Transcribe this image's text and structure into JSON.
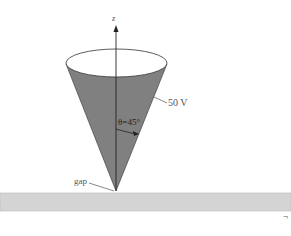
{
  "diagram": {
    "axis_label": "z",
    "voltage_label": "50 V",
    "angle_label": "θ=45°",
    "gap_label": "gap",
    "corner_mark": "¬"
  },
  "colors": {
    "cone_fill": "#808080",
    "plate_fill": "#d4d4d4",
    "line": "#222222",
    "background": "#ffffff"
  }
}
